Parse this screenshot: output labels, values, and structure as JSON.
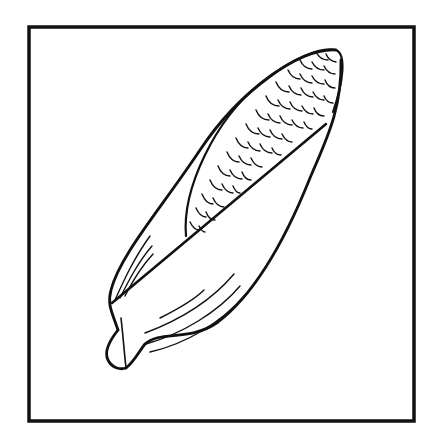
{
  "image": {
    "subject": "ear of corn with husk, line drawing",
    "background_color": "#ffffff",
    "ink_color": "#111111",
    "frame": {
      "x": 28,
      "y": 26,
      "width": 387,
      "height": 396,
      "stroke_width": 4
    }
  }
}
